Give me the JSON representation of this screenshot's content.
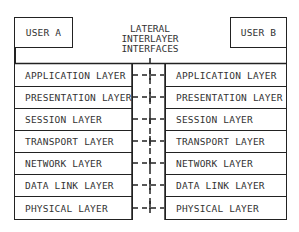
{
  "diagram": {
    "title_lines": [
      "LATERAL",
      "INTERLAYER",
      "INTERFACES"
    ],
    "user_a": "USER A",
    "user_b": "USER B",
    "layers": [
      "APPLICATION LAYER",
      "PRESENTATION LAYER",
      "SESSION LAYER",
      "TRANSPORT LAYER",
      "NETWORK LAYER",
      "DATA LINK LAYER",
      "PHYSICAL LAYER"
    ],
    "colors": {
      "line": "#222222",
      "text": "#333333",
      "background": "#ffffff"
    }
  }
}
